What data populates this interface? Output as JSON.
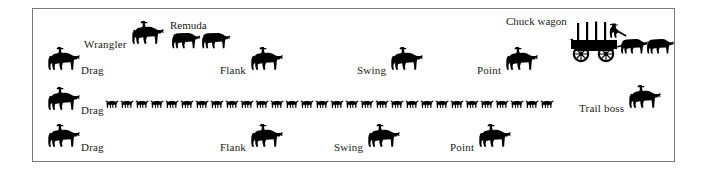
{
  "figure": {
    "kind": "cattle-drive-formation-diagram",
    "frame": {
      "border_color": "#7a7a7a",
      "background": "#ffffff"
    },
    "ink_color": "#000000",
    "text_color": "#1a1a1a"
  },
  "positions": [
    {
      "id": "wrangler",
      "label": "Wrangler",
      "icon": "mounted-rider-icon",
      "label_side": "left",
      "row": "top",
      "x": 83,
      "y": 18
    },
    {
      "id": "remuda-1",
      "label": "Remuda",
      "icon": "loose-horse-icon",
      "label_side": "above",
      "row": "top",
      "x": 170,
      "y": 26
    },
    {
      "id": "remuda-2",
      "label": "",
      "icon": "loose-horse-icon",
      "label_side": "none",
      "row": "top",
      "x": 200,
      "y": 26
    },
    {
      "id": "chuck-wagon",
      "label": "Chuck wagon",
      "icon": "chuck-wagon-icon",
      "label_side": "above",
      "row": "top",
      "x": 570,
      "y": 28
    },
    {
      "id": "drag-top",
      "label": "Drag",
      "icon": "mounted-rider-icon",
      "label_side": "right",
      "row": "upper",
      "x": 40,
      "y": 45
    },
    {
      "id": "flank-top",
      "label": "Flank",
      "icon": "mounted-rider-icon",
      "label_side": "left",
      "row": "upper",
      "x": 243,
      "y": 45
    },
    {
      "id": "swing-top",
      "label": "Swing",
      "icon": "mounted-rider-icon",
      "label_side": "left",
      "row": "upper",
      "x": 385,
      "y": 45
    },
    {
      "id": "point-top",
      "label": "Point",
      "icon": "mounted-rider-icon",
      "label_side": "left",
      "row": "upper",
      "x": 505,
      "y": 45
    },
    {
      "id": "drag-middle",
      "label": "Drag",
      "icon": "mounted-rider-icon",
      "label_side": "right",
      "row": "middle",
      "x": 40,
      "y": 85
    },
    {
      "id": "trail-boss",
      "label": "Trail boss",
      "icon": "mounted-rider-icon",
      "label_side": "left",
      "row": "middle",
      "x": 620,
      "y": 83
    },
    {
      "id": "drag-bottom",
      "label": "Drag",
      "icon": "mounted-rider-icon",
      "label_side": "right",
      "row": "lower",
      "x": 40,
      "y": 122
    },
    {
      "id": "flank-bottom",
      "label": "Flank",
      "icon": "mounted-rider-icon",
      "label_side": "left",
      "row": "lower",
      "x": 243,
      "y": 122
    },
    {
      "id": "swing-bottom",
      "label": "Swing",
      "icon": "mounted-rider-icon",
      "label_side": "left",
      "row": "lower",
      "x": 362,
      "y": 122
    },
    {
      "id": "point-bottom",
      "label": "Point",
      "icon": "mounted-rider-icon",
      "label_side": "left",
      "row": "lower",
      "x": 478,
      "y": 122
    }
  ],
  "herd": {
    "id": "cattle-herd",
    "icon": "longhorn-steer-icon",
    "count": 30,
    "x": 104,
    "y": 95,
    "spacing": 15
  },
  "labels": {
    "wrangler": "Wrangler",
    "remuda": "Remuda",
    "chuck_wagon": "Chuck wagon",
    "trail_boss": "Trail boss",
    "drag": "Drag",
    "flank": "Flank",
    "swing": "Swing",
    "point": "Point"
  }
}
